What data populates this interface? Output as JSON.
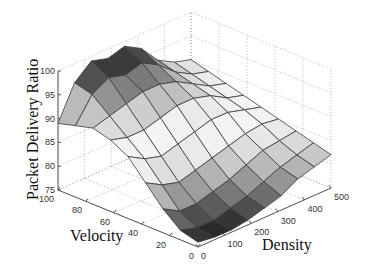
{
  "chart_data": {
    "type": "surface3d",
    "title": "",
    "xlabel": "Density",
    "ylabel": "Velocity",
    "zlabel": "Packet Delivery Ratio",
    "x_ticks": [
      "0",
      "100",
      "200",
      "300",
      "400",
      "500"
    ],
    "y_ticks": [
      "0",
      "20",
      "40",
      "60",
      "80",
      "100"
    ],
    "z_ticks": [
      "75",
      "80",
      "85",
      "90",
      "95",
      "100"
    ],
    "xlim": [
      0,
      500
    ],
    "ylim": [
      0,
      100
    ],
    "zlim": [
      75,
      100
    ],
    "grid": true,
    "colormap": "gray",
    "x": [
      0,
      62.5,
      125,
      187.5,
      250,
      312.5,
      375,
      437.5,
      500
    ],
    "y": [
      0,
      12.5,
      25,
      37.5,
      50,
      62.5,
      75,
      87.5,
      100
    ],
    "z": [
      [
        76,
        75.5,
        75.5,
        76,
        77,
        78,
        80,
        81,
        82
      ],
      [
        77,
        76,
        76,
        77,
        78,
        79.5,
        81,
        82,
        83
      ],
      [
        80,
        78,
        78,
        79,
        80,
        81.5,
        83,
        83.5,
        84
      ],
      [
        84,
        82,
        81,
        82,
        83,
        84,
        85,
        85.5,
        85
      ],
      [
        88,
        86,
        85,
        86,
        87,
        88,
        88,
        87,
        86
      ],
      [
        90,
        89,
        89,
        90,
        91,
        91,
        90,
        88,
        87
      ],
      [
        91,
        92,
        93,
        94,
        94,
        93,
        91,
        89,
        88
      ],
      [
        90,
        95,
        97,
        96,
        97,
        95,
        92,
        90,
        89
      ],
      [
        89,
        96,
        99,
        98,
        99,
        97,
        93,
        91,
        90
      ]
    ]
  }
}
